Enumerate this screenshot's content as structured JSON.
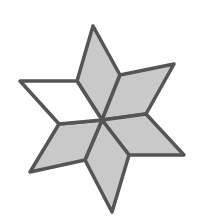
{
  "figure": {
    "colors": {
      "shaded": "#c9c9c9",
      "unshaded": "#ffffff",
      "stroke": "#555555",
      "background": "#ffffff"
    },
    "center": [
      102,
      120
    ],
    "rhombi": [
      {
        "id": "top",
        "shaded": true,
        "points": "102,120 77,81 93,26 120,75"
      },
      {
        "id": "upper-right",
        "shaded": true,
        "points": "102,120 120,75 174,64 146,114"
      },
      {
        "id": "lower-right",
        "shaded": true,
        "points": "102,120 146,114 184,155 129,155"
      },
      {
        "id": "bottom",
        "shaded": true,
        "points": "102,120 129,155 112,212 85,160"
      },
      {
        "id": "lower-left",
        "shaded": true,
        "points": "102,120 85,160 30,172 59,124"
      },
      {
        "id": "upper-left",
        "shaded": false,
        "points": "102,120 59,124 20,81 77,81"
      }
    ]
  }
}
